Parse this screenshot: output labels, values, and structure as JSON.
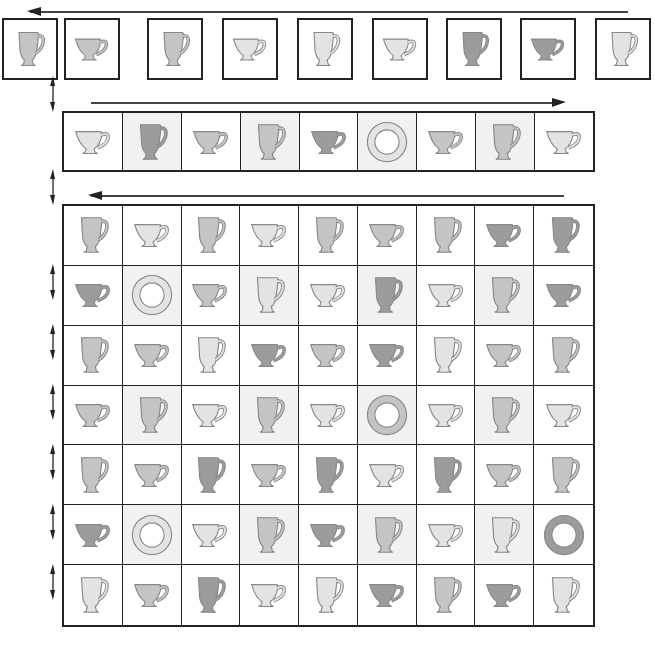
{
  "colors": {
    "light": "#e3e3e3",
    "medium": "#c4c4c4",
    "dark": "#9c9c9c",
    "outline": "#888888",
    "cell_shaded": "#f1f1f1",
    "cell_white": "#ffffff",
    "border": "#222222"
  },
  "arrows": {
    "top": {
      "direction": "left"
    },
    "row2": {
      "direction": "right"
    },
    "grid": {
      "direction": "left"
    }
  },
  "top_row": [
    {
      "shape": "mug",
      "shade": "medium"
    },
    {
      "shape": "teacup",
      "shade": "medium"
    },
    {
      "shape": "mug",
      "shade": "medium"
    },
    {
      "shape": "teacup",
      "shade": "light"
    },
    {
      "shape": "mug",
      "shade": "light"
    },
    {
      "shape": "teacup",
      "shade": "light"
    },
    {
      "shape": "mug",
      "shade": "dark"
    },
    {
      "shape": "teacup",
      "shade": "dark"
    },
    {
      "shape": "mug",
      "shade": "light"
    }
  ],
  "second_row": [
    {
      "shape": "teacup",
      "shade": "light",
      "bg": "white"
    },
    {
      "shape": "mug",
      "shade": "dark",
      "bg": "shaded"
    },
    {
      "shape": "teacup",
      "shade": "medium",
      "bg": "white"
    },
    {
      "shape": "mug",
      "shade": "medium",
      "bg": "shaded"
    },
    {
      "shape": "teacup",
      "shade": "dark",
      "bg": "white"
    },
    {
      "shape": "plate",
      "shade": "light",
      "bg": "shaded"
    },
    {
      "shape": "teacup",
      "shade": "medium",
      "bg": "white"
    },
    {
      "shape": "mug",
      "shade": "medium",
      "bg": "shaded"
    },
    {
      "shape": "teacup",
      "shade": "light",
      "bg": "white"
    }
  ],
  "grid": [
    [
      {
        "shape": "mug",
        "shade": "medium",
        "bg": "white"
      },
      {
        "shape": "teacup",
        "shade": "light",
        "bg": "white"
      },
      {
        "shape": "mug",
        "shade": "medium",
        "bg": "white"
      },
      {
        "shape": "teacup",
        "shade": "light",
        "bg": "white"
      },
      {
        "shape": "mug",
        "shade": "medium",
        "bg": "white"
      },
      {
        "shape": "teacup",
        "shade": "medium",
        "bg": "white"
      },
      {
        "shape": "mug",
        "shade": "medium",
        "bg": "white"
      },
      {
        "shape": "teacup",
        "shade": "dark",
        "bg": "white"
      },
      {
        "shape": "mug",
        "shade": "dark",
        "bg": "white"
      }
    ],
    [
      {
        "shape": "teacup",
        "shade": "dark",
        "bg": "white"
      },
      {
        "shape": "plate",
        "shade": "light",
        "bg": "shaded"
      },
      {
        "shape": "teacup",
        "shade": "medium",
        "bg": "white"
      },
      {
        "shape": "mug",
        "shade": "light",
        "bg": "shaded"
      },
      {
        "shape": "teacup",
        "shade": "light",
        "bg": "white"
      },
      {
        "shape": "mug",
        "shade": "dark",
        "bg": "shaded"
      },
      {
        "shape": "teacup",
        "shade": "light",
        "bg": "white"
      },
      {
        "shape": "mug",
        "shade": "medium",
        "bg": "shaded"
      },
      {
        "shape": "teacup",
        "shade": "dark",
        "bg": "white"
      }
    ],
    [
      {
        "shape": "mug",
        "shade": "medium",
        "bg": "white"
      },
      {
        "shape": "teacup",
        "shade": "medium",
        "bg": "white"
      },
      {
        "shape": "mug",
        "shade": "light",
        "bg": "white"
      },
      {
        "shape": "teacup",
        "shade": "dark",
        "bg": "white"
      },
      {
        "shape": "teacup",
        "shade": "medium",
        "bg": "white"
      },
      {
        "shape": "teacup",
        "shade": "dark",
        "bg": "white"
      },
      {
        "shape": "mug",
        "shade": "light",
        "bg": "white"
      },
      {
        "shape": "teacup",
        "shade": "medium",
        "bg": "white"
      },
      {
        "shape": "mug",
        "shade": "medium",
        "bg": "white"
      }
    ],
    [
      {
        "shape": "teacup",
        "shade": "medium",
        "bg": "white"
      },
      {
        "shape": "mug",
        "shade": "medium",
        "bg": "shaded"
      },
      {
        "shape": "teacup",
        "shade": "light",
        "bg": "white"
      },
      {
        "shape": "mug",
        "shade": "medium",
        "bg": "shaded"
      },
      {
        "shape": "teacup",
        "shade": "light",
        "bg": "white"
      },
      {
        "shape": "plate",
        "shade": "medium",
        "bg": "shaded"
      },
      {
        "shape": "teacup",
        "shade": "light",
        "bg": "white"
      },
      {
        "shape": "mug",
        "shade": "medium",
        "bg": "shaded"
      },
      {
        "shape": "teacup",
        "shade": "light",
        "bg": "white"
      }
    ],
    [
      {
        "shape": "mug",
        "shade": "medium",
        "bg": "white"
      },
      {
        "shape": "teacup",
        "shade": "medium",
        "bg": "white"
      },
      {
        "shape": "mug",
        "shade": "dark",
        "bg": "white"
      },
      {
        "shape": "teacup",
        "shade": "medium",
        "bg": "white"
      },
      {
        "shape": "mug",
        "shade": "dark",
        "bg": "white"
      },
      {
        "shape": "teacup",
        "shade": "light",
        "bg": "white"
      },
      {
        "shape": "mug",
        "shade": "dark",
        "bg": "white"
      },
      {
        "shape": "teacup",
        "shade": "medium",
        "bg": "white"
      },
      {
        "shape": "mug",
        "shade": "medium",
        "bg": "white"
      }
    ],
    [
      {
        "shape": "teacup",
        "shade": "dark",
        "bg": "white"
      },
      {
        "shape": "plate",
        "shade": "light",
        "bg": "shaded"
      },
      {
        "shape": "teacup",
        "shade": "light",
        "bg": "white"
      },
      {
        "shape": "mug",
        "shade": "medium",
        "bg": "shaded"
      },
      {
        "shape": "teacup",
        "shade": "dark",
        "bg": "white"
      },
      {
        "shape": "mug",
        "shade": "medium",
        "bg": "shaded"
      },
      {
        "shape": "teacup",
        "shade": "light",
        "bg": "white"
      },
      {
        "shape": "mug",
        "shade": "light",
        "bg": "shaded"
      },
      {
        "shape": "plate",
        "shade": "dark",
        "bg": "white"
      }
    ],
    [
      {
        "shape": "mug",
        "shade": "light",
        "bg": "white"
      },
      {
        "shape": "teacup",
        "shade": "medium",
        "bg": "white"
      },
      {
        "shape": "mug",
        "shade": "dark",
        "bg": "white"
      },
      {
        "shape": "teacup",
        "shade": "light",
        "bg": "white"
      },
      {
        "shape": "mug",
        "shade": "light",
        "bg": "white"
      },
      {
        "shape": "teacup",
        "shade": "dark",
        "bg": "white"
      },
      {
        "shape": "mug",
        "shade": "medium",
        "bg": "white"
      },
      {
        "shape": "teacup",
        "shade": "dark",
        "bg": "white"
      },
      {
        "shape": "mug",
        "shade": "light",
        "bg": "white"
      }
    ]
  ]
}
